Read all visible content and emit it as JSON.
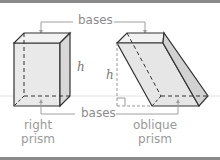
{
  "diagram": {
    "top_label": "bases",
    "bottom_label": "bases",
    "height_label_right": "h",
    "height_label_oblique": "h",
    "right_caption_line1": "right",
    "right_caption_line2": "prism",
    "oblique_caption_line1": "oblique",
    "oblique_caption_line2": "prism"
  },
  "colors": {
    "frame_bar": "#8a8a8a",
    "label_text": "#8c8c8c",
    "edge": "#333333",
    "face_light": "#eeeeee",
    "face_shade": "#dddddd"
  }
}
